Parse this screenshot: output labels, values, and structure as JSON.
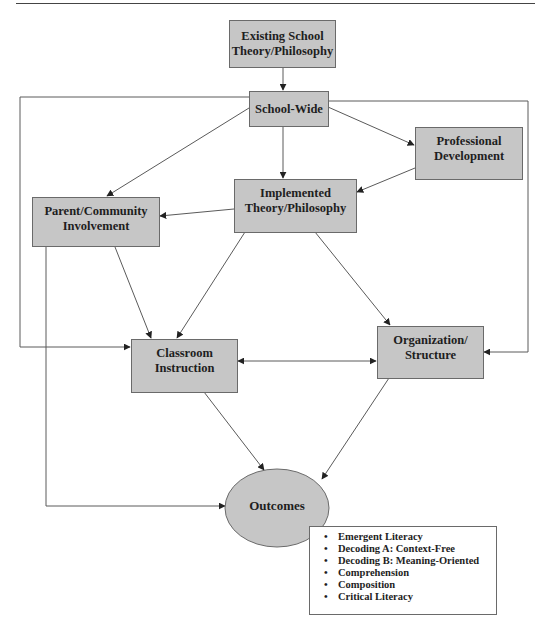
{
  "diagram": {
    "nodes": {
      "existing": {
        "line1": "Existing School",
        "line2": "Theory/Philosophy"
      },
      "school_wide": {
        "line1": "School-Wide"
      },
      "professional": {
        "line1": "Professional",
        "line2": "Development"
      },
      "implemented": {
        "line1": "Implemented",
        "line2": "Theory/Philosophy"
      },
      "parent": {
        "line1": "Parent/Community",
        "line2": "Involvement"
      },
      "classroom": {
        "line1": "Classroom",
        "line2": "Instruction"
      },
      "organization": {
        "line1": "Organization/",
        "line2": "Structure"
      },
      "outcomes": {
        "line1": "Outcomes"
      }
    },
    "outcomes_list": {
      "bullet": "•",
      "items": [
        "Emergent Literacy",
        "Decoding A: Context-Free",
        "Decoding B: Meaning-Oriented",
        "Comprehension",
        "Composition",
        "Critical Literacy"
      ]
    },
    "edges": [
      {
        "from": "Existing School Theory/Philosophy",
        "to": "School-Wide"
      },
      {
        "from": "School-Wide",
        "to": "Parent/Community Involvement"
      },
      {
        "from": "School-Wide",
        "to": "Implemented Theory/Philosophy"
      },
      {
        "from": "School-Wide",
        "to": "Professional Development"
      },
      {
        "from": "School-Wide",
        "to": "Classroom Instruction",
        "routing": "left border"
      },
      {
        "from": "School-Wide",
        "to": "Organization/Structure",
        "routing": "right border"
      },
      {
        "from": "Professional Development",
        "to": "Implemented Theory/Philosophy"
      },
      {
        "from": "Implemented Theory/Philosophy",
        "to": "Parent/Community Involvement"
      },
      {
        "from": "Implemented Theory/Philosophy",
        "to": "Classroom Instruction"
      },
      {
        "from": "Implemented Theory/Philosophy",
        "to": "Organization/Structure"
      },
      {
        "from": "Parent/Community Involvement",
        "to": "Classroom Instruction"
      },
      {
        "from": "Parent/Community Involvement",
        "to": "Outcomes"
      },
      {
        "from": "Classroom Instruction",
        "to": "Organization/Structure",
        "bidirectional": true
      },
      {
        "from": "Classroom Instruction",
        "to": "Outcomes"
      },
      {
        "from": "Organization/Structure",
        "to": "Outcomes"
      }
    ],
    "colors": {
      "box_fill": "#c6c6c6",
      "box_border": "#6a6a6a",
      "line": "#555555",
      "text": "#1e1e1e"
    }
  }
}
